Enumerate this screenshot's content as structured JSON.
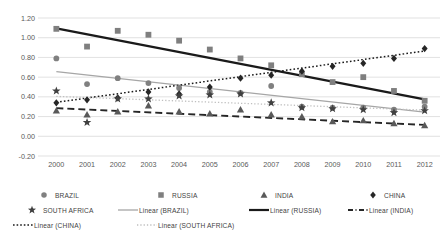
{
  "chart_data": {
    "type": "scatter",
    "title": "",
    "xlabel": "",
    "ylabel": "",
    "x": [
      2000,
      2001,
      2002,
      2003,
      2004,
      2005,
      2006,
      2007,
      2008,
      2009,
      2010,
      2011,
      2012
    ],
    "xlim": [
      1999.5,
      2012.5
    ],
    "ylim": [
      -0.2,
      1.2
    ],
    "ytick_labels": [
      "1.20",
      "1.00",
      "0.80",
      "0.60",
      "0.40",
      "0.20",
      "0.00",
      "-0.20"
    ],
    "ytick_values": [
      1.2,
      1.0,
      0.8,
      0.6,
      0.4,
      0.2,
      0.0,
      -0.2
    ],
    "xtick_labels": [
      "2000",
      "2001",
      "2002",
      "2003",
      "2004",
      "2005",
      "2006",
      "2007",
      "2008",
      "2009",
      "2010",
      "2011",
      "2012"
    ],
    "grid": true,
    "legend_position": "bottom",
    "series": [
      {
        "name": "BRAZIL",
        "marker": "circle",
        "color": "#808080",
        "values": [
          0.79,
          0.53,
          0.59,
          0.54,
          0.49,
          0.45,
          0.44,
          0.51,
          0.3,
          0.29,
          0.29,
          0.27,
          0.3
        ]
      },
      {
        "name": "RUSSIA",
        "marker": "square",
        "color": "#7f7f7f",
        "values": [
          1.09,
          0.91,
          1.07,
          1.03,
          0.97,
          0.88,
          0.79,
          0.72,
          0.63,
          0.55,
          0.6,
          0.46,
          0.36
        ]
      },
      {
        "name": "INDIA",
        "marker": "triangle",
        "color": "#595959",
        "values": [
          0.26,
          0.22,
          0.25,
          0.31,
          0.25,
          0.23,
          0.27,
          0.22,
          0.2,
          0.15,
          0.16,
          0.13,
          0.11
        ]
      },
      {
        "name": "CHINA",
        "marker": "diamond",
        "color": "#262626",
        "values": [
          0.34,
          0.37,
          0.39,
          0.45,
          0.43,
          0.5,
          0.59,
          0.62,
          0.66,
          0.71,
          0.74,
          0.79,
          0.89
        ]
      },
      {
        "name": "SOUTH AFRICA",
        "marker": "star",
        "color": "#404040",
        "values": [
          0.46,
          0.14,
          0.38,
          0.38,
          0.41,
          0.42,
          0.43,
          0.34,
          0.29,
          0.28,
          0.27,
          0.24,
          0.26
        ]
      }
    ],
    "trendlines": [
      {
        "name": "Linear (BRAZIL)",
        "style": "solid-light",
        "color": "#a6a6a6",
        "y_start": 0.655,
        "y_end": 0.245
      },
      {
        "name": "Linear (RUSSIA)",
        "style": "solid-heavy",
        "color": "#1a1a1a",
        "y_start": 1.095,
        "y_end": 0.375
      },
      {
        "name": "Linear (INDIA)",
        "style": "dashed",
        "color": "#262626",
        "y_start": 0.285,
        "y_end": 0.115
      },
      {
        "name": "Linear (CHINA)",
        "style": "dotted-dark",
        "color": "#1a1a1a",
        "y_start": 0.345,
        "y_end": 0.865
      },
      {
        "name": "Linear (SOUTH AFRICA)",
        "style": "dotted-light",
        "color": "#bfbfbf",
        "y_start": 0.405,
        "y_end": 0.265
      }
    ]
  },
  "legend": {
    "rows": [
      [
        {
          "label": "BRAZIL",
          "key": "circle-marker"
        },
        {
          "label": "RUSSIA",
          "key": "square-marker"
        },
        {
          "label": "INDIA",
          "key": "triangle-marker"
        },
        {
          "label": "CHINA",
          "key": "diamond-marker"
        }
      ],
      [
        {
          "label": "SOUTH AFRICA",
          "key": "star-marker"
        },
        {
          "label": "Linear (BRAZIL)",
          "key": "solid-light-line"
        },
        {
          "label": "Linear (RUSSIA)",
          "key": "solid-heavy-line"
        },
        {
          "label": "Linear (INDIA)",
          "key": "dash-dot-line"
        }
      ],
      [
        {
          "label": "Linear (CHINA)",
          "key": "dotted-dark-line"
        },
        {
          "label": "Linear (SOUTH AFRICA)",
          "key": "dotted-light-line"
        }
      ]
    ]
  }
}
